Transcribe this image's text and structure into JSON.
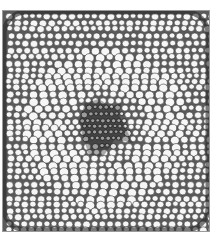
{
  "image": {
    "subject": "micrograph of plant root cross-section",
    "colors": {
      "background": "#ffffff",
      "frame_border": "#9a9a9a",
      "cell_fill": "#f6f6f6",
      "cell_wall": "#3a3a3a",
      "stele_dark": "#2a2a2a",
      "cortex_light": "#e8e8e8"
    },
    "frame": {
      "x": 2,
      "y": 10,
      "width": 208,
      "height": 222
    }
  }
}
